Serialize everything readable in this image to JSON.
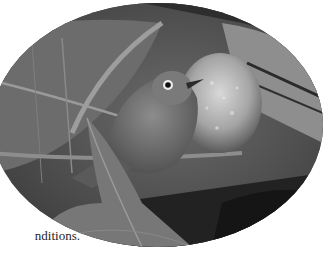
{
  "article": {
    "text_lines": [
      "n",
      "rees",
      "nditions."
    ]
  },
  "photo": {
    "subject": "small bird (white-eye) perched among leaves",
    "style": "black-and-white",
    "shape": "ellipse"
  }
}
